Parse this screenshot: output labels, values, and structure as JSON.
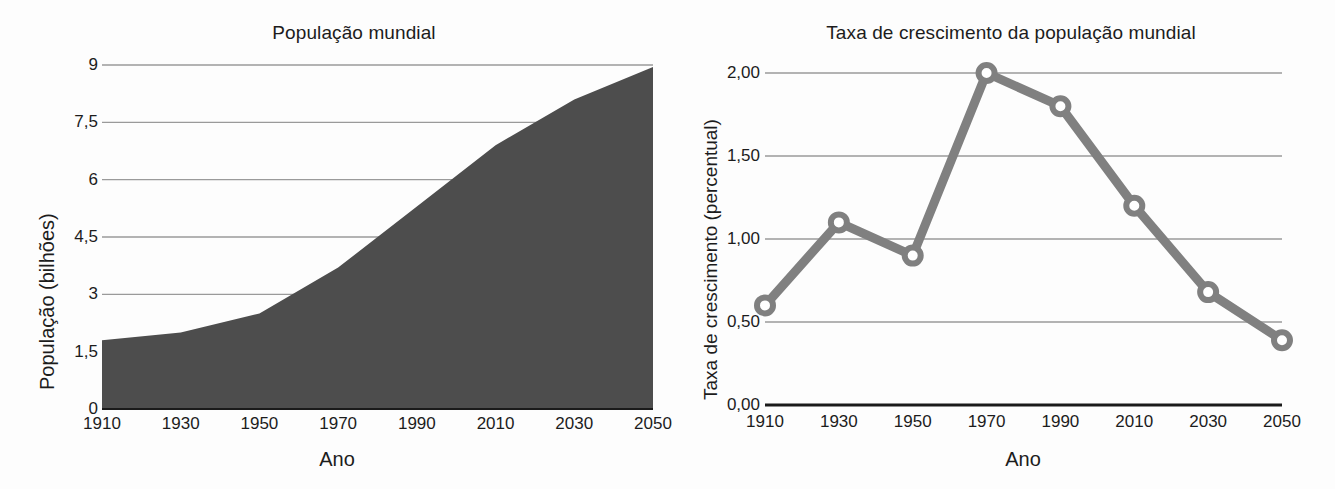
{
  "figure": {
    "charts": [
      {
        "id": "world-population",
        "title": "População mundial",
        "xlabel": "Ano",
        "ylabel": "População (bilhões)"
      },
      {
        "id": "world-population-growth-rate",
        "title": "Taxa de crescimento da população mundial",
        "xlabel": "Ano",
        "ylabel": "Taxa de crescimento (percentual)"
      }
    ]
  },
  "chart_data": [
    {
      "type": "area",
      "title": "População mundial",
      "xlabel": "Ano",
      "ylabel": "População (bilhões)",
      "x": [
        1910,
        1930,
        1950,
        1970,
        1990,
        2010,
        2030,
        2050
      ],
      "values": [
        1.8,
        2.0,
        2.5,
        3.7,
        5.3,
        6.9,
        8.1,
        8.95
      ],
      "categories": [
        "1910",
        "1930",
        "1950",
        "1970",
        "1990",
        "2010",
        "2030",
        "2050"
      ],
      "xticks": [
        "1910",
        "1930",
        "1950",
        "1970",
        "1990",
        "2010",
        "2030",
        "2050"
      ],
      "yticks": [
        "0",
        "1,5",
        "3",
        "4,5",
        "6",
        "7,5",
        "9"
      ],
      "ytickvalues": [
        0,
        1.5,
        3,
        4.5,
        6,
        7.5,
        9
      ],
      "xlim": [
        1910,
        2050
      ],
      "ylim": [
        0,
        9
      ],
      "grid": "horizontal",
      "legend": "none",
      "series_color": "#4d4d4d",
      "gridline_color": "#9a9a9a",
      "axis_color": "#1a1a1a"
    },
    {
      "type": "line",
      "title": "Taxa de crescimento da população mundial",
      "xlabel": "Ano",
      "ylabel": "Taxa de crescimento (percentual)",
      "x": [
        1910,
        1930,
        1950,
        1970,
        1990,
        2010,
        2030,
        2050
      ],
      "values": [
        0.6,
        1.1,
        0.9,
        2.0,
        1.8,
        1.2,
        0.68,
        0.39
      ],
      "categories": [
        "1910",
        "1930",
        "1950",
        "1970",
        "1990",
        "2010",
        "2030",
        "2050"
      ],
      "xticks": [
        "1910",
        "1930",
        "1950",
        "1970",
        "1990",
        "2010",
        "2030",
        "2050"
      ],
      "yticks": [
        "0,00",
        "0,50",
        "1,00",
        "1,50",
        "2,00"
      ],
      "ytickvalues": [
        0.0,
        0.5,
        1.0,
        1.5,
        2.0
      ],
      "xlim": [
        1910,
        2050
      ],
      "ylim": [
        0.0,
        2.0
      ],
      "grid": "horizontal",
      "legend": "none",
      "markers": "open-circle",
      "series_color": "#808080",
      "gridline_color": "#9a9a9a",
      "axis_color": "#1a1a1a"
    }
  ]
}
